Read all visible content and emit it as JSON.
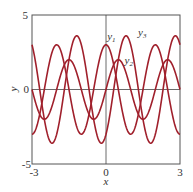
{
  "chart_data": {
    "type": "line",
    "title": "",
    "xlabel": "x",
    "ylabel": "y",
    "xlim": [
      -3,
      3
    ],
    "ylim": [
      -5,
      5
    ],
    "xticks": [
      "-3",
      "0",
      "3"
    ],
    "yticks": [
      "5",
      "0",
      "-5"
    ],
    "grid": false,
    "legend": "inline labels",
    "series": [
      {
        "name": "y1",
        "formula": "3cos(πx)",
        "amplitude": 3,
        "period": 2,
        "x": [
          -3,
          -2.5,
          -2,
          -1.5,
          -1,
          -0.5,
          0,
          0.5,
          1,
          1.5,
          2,
          2.5,
          3
        ],
        "values": [
          -3,
          0,
          3,
          0,
          -3,
          0,
          3,
          0,
          -3,
          0,
          3,
          0,
          -3
        ]
      },
      {
        "name": "y2",
        "formula": "2sin(πx)",
        "amplitude": 2,
        "period": 2,
        "x": [
          -3,
          -2.5,
          -2,
          -1.5,
          -1,
          -0.5,
          0,
          0.5,
          1,
          1.5,
          2,
          2.5,
          3
        ],
        "values": [
          0,
          -2,
          0,
          2,
          0,
          -2,
          0,
          2,
          0,
          -2,
          0,
          2,
          0
        ]
      },
      {
        "name": "y3",
        "formula": "y2 - y1",
        "amplitude": 3.6,
        "period": 2,
        "x": [
          -3,
          -2.5,
          -2,
          -1.5,
          -1,
          -0.5,
          0,
          0.5,
          1,
          1.5,
          2,
          2.5,
          3
        ],
        "values": [
          3,
          -2,
          -3,
          2,
          3,
          -2,
          -3,
          2,
          3,
          -2,
          -3,
          2,
          3
        ]
      }
    ],
    "annotations": [
      {
        "text": "y",
        "sub": "1",
        "x": 0.05,
        "y": 3.3
      },
      {
        "text": "y",
        "sub": "3",
        "x": 1.3,
        "y": 3.6
      },
      {
        "text": "y",
        "sub": "2",
        "x": 0.75,
        "y": 1.7
      }
    ]
  },
  "colors": {
    "curve": "#a0202c",
    "axis": "#444444",
    "frame": "#555555"
  }
}
